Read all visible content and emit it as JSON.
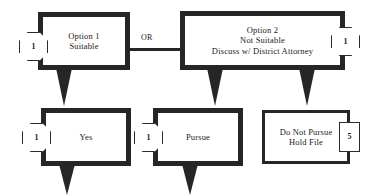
{
  "diagram": {
    "background_color": "#ffffff",
    "stroke_color": "#262626",
    "nodes": {
      "option1": {
        "label": "Option 1\nSuitable",
        "badge": "1",
        "badge_shape": "octagon",
        "badge_side": "left"
      },
      "option2": {
        "label": "Option 2\nNot Suitable\nDiscuss w/ District Attorney",
        "badge": "1",
        "badge_shape": "octagon",
        "badge_side": "right"
      },
      "yes": {
        "label": "Yes",
        "badge": "1",
        "badge_shape": "octagon",
        "badge_side": "left"
      },
      "pursue": {
        "label": "Pursue",
        "badge": "1",
        "badge_shape": "octagon",
        "badge_side": "left"
      },
      "do_not_pursue": {
        "label": "Do Not Pursue\nHold File",
        "badge": "5",
        "badge_shape": "rectangle",
        "badge_side": "right"
      }
    },
    "connectors": {
      "or_label": "OR"
    }
  }
}
